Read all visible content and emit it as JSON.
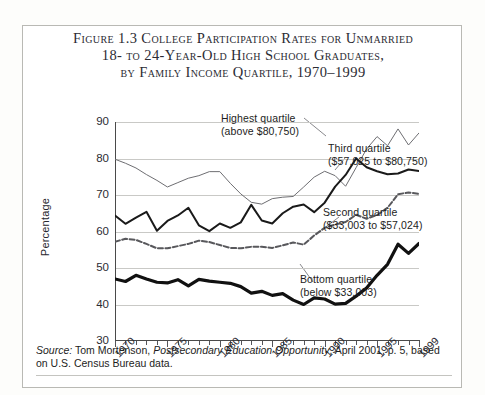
{
  "figure": {
    "title_lines": [
      "Figure 1.3  College Participation Rates for Unmarried",
      "18- to 24-Year-Old High School Graduates,",
      "by Family Income Quartile, 1970–1999"
    ],
    "source": {
      "label": "Source:",
      "author": "Tom Mortenson,",
      "publication": "Postsecondary Education Opportunity",
      "rest": ", April 2001, p. 5, based on U.S. Census Bureau data."
    }
  },
  "chart_data": {
    "type": "line",
    "title": "Figure 1.3  College Participation Rates for Unmarried 18- to 24-Year-Old High School Graduates, by Family Income Quartile, 1970–1999",
    "xlabel": "",
    "ylabel": "Percentage",
    "ylim": [
      30,
      90
    ],
    "yticks": [
      30,
      40,
      50,
      60,
      70,
      80,
      90
    ],
    "xlim": [
      1970,
      1999
    ],
    "xticks": [
      1970,
      1975,
      1980,
      1985,
      1990,
      1995,
      1999
    ],
    "xtick_labels": [
      "1970",
      "1975",
      "1980",
      "1985",
      "1990",
      "1995",
      "1999"
    ],
    "grid": true,
    "legend": "annotations-on-plot",
    "x": [
      1970,
      1971,
      1972,
      1973,
      1974,
      1975,
      1976,
      1977,
      1978,
      1979,
      1980,
      1981,
      1982,
      1983,
      1984,
      1985,
      1986,
      1987,
      1988,
      1989,
      1990,
      1991,
      1992,
      1993,
      1994,
      1995,
      1996,
      1997,
      1998,
      1999
    ],
    "series": [
      {
        "name": "Highest quartile",
        "range_label": "(above $80,750)",
        "style": "thin-solid",
        "color": "#6e6e72",
        "values": [
          79.8,
          78.7,
          77.4,
          75.6,
          74.0,
          72.2,
          73.4,
          74.6,
          75.3,
          76.4,
          76.4,
          73.2,
          70.3,
          68.0,
          67.5,
          69.0,
          69.4,
          69.6,
          72.2,
          74.9,
          76.5,
          75.3,
          72.4,
          77.5,
          82.6,
          86.0,
          83.5,
          88.1,
          83.7,
          87.0
        ]
      },
      {
        "name": "Third quartile",
        "range_label": "($57,025 to $80,750)",
        "style": "medium-solid",
        "color": "#1a1a1a",
        "values": [
          64.4,
          62.1,
          63.8,
          65.4,
          60.2,
          62.9,
          64.4,
          66.5,
          61.7,
          60.1,
          62.2,
          61.0,
          62.5,
          67.3,
          63.0,
          62.2,
          65.0,
          66.8,
          67.4,
          65.3,
          67.9,
          72.3,
          75.5,
          80.0,
          77.6,
          76.5,
          75.7,
          75.9,
          77.0,
          76.6
        ]
      },
      {
        "name": "Second quartile",
        "range_label": "($33,003 to $57,024)",
        "style": "dashed",
        "color": "#58585c",
        "values": [
          57.2,
          58.0,
          57.7,
          56.6,
          55.4,
          55.4,
          56.0,
          56.6,
          57.5,
          57.1,
          56.3,
          55.5,
          55.4,
          55.8,
          55.8,
          55.5,
          56.2,
          57.0,
          56.4,
          58.9,
          61.0,
          61.9,
          62.6,
          64.6,
          63.5,
          64.5,
          66.5,
          70.2,
          70.7,
          70.3
        ]
      },
      {
        "name": "Bottom quartile",
        "range_label": "(below $33,003)",
        "style": "thick-solid",
        "color": "#111111",
        "values": [
          47.0,
          46.3,
          48.0,
          47.0,
          46.1,
          45.9,
          46.8,
          45.1,
          46.9,
          46.4,
          46.1,
          45.8,
          44.9,
          43.1,
          43.6,
          42.5,
          43.0,
          41.2,
          40.0,
          41.8,
          41.5,
          40.1,
          40.3,
          42.3,
          44.5,
          48.0,
          51.0,
          56.5,
          54.0,
          56.7
        ]
      }
    ],
    "annotations": [
      {
        "text_line1": "Highest quartile",
        "text_line2": "(above $80,750)"
      },
      {
        "text_line1": "Third quartile",
        "text_line2": "($57,025 to $80,750)"
      },
      {
        "text_line1": "Second quartile",
        "text_line2": "($33,003 to $57,024)"
      },
      {
        "text_line1": "Bottom quartile",
        "text_line2": "(below $33,003)"
      }
    ]
  }
}
